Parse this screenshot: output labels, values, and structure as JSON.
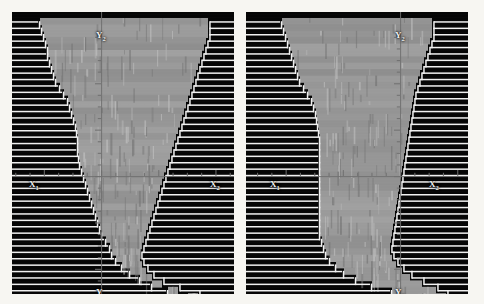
{
  "figure": {
    "kind": "dual-panel-scanline-profile-plot",
    "background_color": "#faf9f6",
    "panel_background_color": "#050505",
    "scanline_color": "#f0f0f0",
    "blob_color": "#969696",
    "axis_color": "#6f6f6f",
    "label_color": "#efefef",
    "panel_count": 2
  },
  "panels": [
    {
      "id": "left",
      "name": "left-profile-panel",
      "x": 12,
      "y": 12,
      "width": 222,
      "height": 282,
      "axis": {
        "origin_x": 89,
        "origin_y": 164,
        "x_left_label": "X",
        "x_left_sub": "1",
        "x_right_label": "X",
        "x_right_sub": "2",
        "y_top_label": "Y",
        "y_top_sub": "2",
        "y_bottom_label": "Y",
        "y_bottom_sub": "1"
      },
      "labels": {
        "x1": {
          "text": "X",
          "sub": "1",
          "x": 17,
          "y": 168
        },
        "x2": {
          "text": "X",
          "sub": "2",
          "x": 198,
          "y": 168
        },
        "y2": {
          "text": "Y",
          "sub": "2",
          "x": 84,
          "y": 19
        },
        "y1": {
          "text": "Y",
          "sub": "1",
          "x": 84,
          "y": 276
        }
      },
      "chart_data": {
        "type": "area",
        "title": "",
        "xlabel": "X",
        "ylabel": "Y",
        "scanline_spacing_px": 6.4,
        "scanline_count": 44,
        "left_profile": [
          28,
          30,
          32,
          34,
          36,
          36,
          38,
          40,
          42,
          44,
          48,
          52,
          56,
          58,
          60,
          62,
          64,
          65,
          66,
          66,
          66,
          67,
          68,
          70,
          72,
          74,
          76,
          78,
          80,
          82,
          84,
          86,
          88,
          90,
          94,
          98,
          100,
          104,
          110,
          118,
          128,
          140,
          156,
          176
        ],
        "right_profile": [
          196,
          196,
          196,
          194,
          192,
          190,
          188,
          186,
          184,
          182,
          180,
          178,
          176,
          174,
          172,
          170,
          168,
          166,
          164,
          162,
          160,
          158,
          156,
          154,
          152,
          150,
          148,
          146,
          144,
          142,
          140,
          138,
          136,
          134,
          132,
          130,
          128,
          128,
          130,
          134,
          140,
          150,
          166,
          186
        ]
      }
    },
    {
      "id": "right",
      "name": "right-profile-panel",
      "x": 246,
      "y": 12,
      "width": 222,
      "height": 282,
      "axis": {
        "origin_x": 154,
        "origin_y": 164,
        "x_left_label": "X",
        "x_left_sub": "1",
        "x_right_label": "X",
        "x_right_sub": "2",
        "y_top_label": "Y",
        "y_top_sub": "2",
        "y_bottom_label": "Y",
        "y_bottom_sub": "1"
      },
      "labels": {
        "x1": {
          "text": "X",
          "sub": "1",
          "x": 24,
          "y": 168
        },
        "x2": {
          "text": "X",
          "sub": "2",
          "x": 183,
          "y": 168
        },
        "y2": {
          "text": "Y",
          "sub": "2",
          "x": 149,
          "y": 19
        },
        "y1": {
          "text": "Y",
          "sub": "1",
          "x": 149,
          "y": 276
        }
      },
      "chart_data": {
        "type": "area",
        "title": "",
        "xlabel": "X",
        "ylabel": "Y",
        "scanline_spacing_px": 6.4,
        "scanline_count": 44,
        "left_profile": [
          36,
          38,
          40,
          42,
          44,
          46,
          48,
          50,
          52,
          54,
          58,
          62,
          66,
          68,
          70,
          71,
          72,
          73,
          74,
          74,
          74,
          74,
          74,
          74,
          74,
          74,
          74,
          74,
          74,
          74,
          74,
          74,
          74,
          74,
          76,
          78,
          80,
          84,
          90,
          98,
          110,
          126,
          146,
          172
        ],
        "right_profile": [
          186,
          186,
          186,
          184,
          182,
          180,
          178,
          176,
          174,
          172,
          170,
          168,
          167,
          166,
          165,
          164,
          163,
          162,
          161,
          160,
          159,
          158,
          157,
          156,
          155,
          154,
          153,
          152,
          151,
          150,
          149,
          148,
          147,
          146,
          145,
          144,
          144,
          146,
          150,
          156,
          164,
          176,
          190,
          200
        ]
      }
    }
  ]
}
